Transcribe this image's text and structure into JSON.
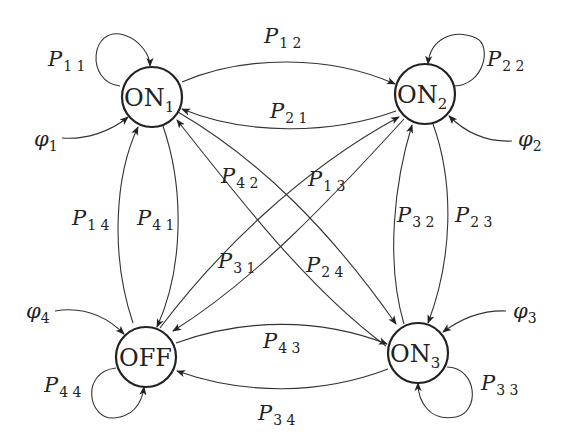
{
  "diagram": {
    "type": "markov-state-transition",
    "nodes": [
      {
        "id": "ON1",
        "base": "ON",
        "sub": "1",
        "x": 152,
        "y": 97
      },
      {
        "id": "ON2",
        "base": "ON",
        "sub": "2",
        "x": 425,
        "y": 94
      },
      {
        "id": "ON3",
        "base": "ON",
        "sub": "3",
        "x": 418,
        "y": 353
      },
      {
        "id": "OFF",
        "base": "OFF",
        "sub": "",
        "x": 146,
        "y": 357
      }
    ],
    "self_loops": [
      {
        "node": "ON1",
        "label": "P",
        "sub": "1 1"
      },
      {
        "node": "ON2",
        "label": "P",
        "sub": "2 2"
      },
      {
        "node": "ON3",
        "label": "P",
        "sub": "3 3"
      },
      {
        "node": "OFF",
        "label": "P",
        "sub": "4 4"
      }
    ],
    "initial_inputs": [
      {
        "node": "ON1",
        "label": "φ",
        "sub": "1"
      },
      {
        "node": "ON2",
        "label": "φ",
        "sub": "2"
      },
      {
        "node": "ON3",
        "label": "φ",
        "sub": "3"
      },
      {
        "node": "OFF",
        "label": "φ",
        "sub": "4"
      }
    ],
    "edges": [
      {
        "from": "ON1",
        "to": "ON2",
        "label": "P",
        "sub": "1 2"
      },
      {
        "from": "ON2",
        "to": "ON1",
        "label": "P",
        "sub": "2 1"
      },
      {
        "from": "ON1",
        "to": "ON3",
        "label": "P",
        "sub": "1 3"
      },
      {
        "from": "ON3",
        "to": "ON1",
        "label": "P",
        "sub": "3 1"
      },
      {
        "from": "ON1",
        "to": "OFF",
        "label": "P",
        "sub": "1 4"
      },
      {
        "from": "OFF",
        "to": "ON1",
        "label": "P",
        "sub": "4 1"
      },
      {
        "from": "ON2",
        "to": "ON3",
        "label": "P",
        "sub": "2 3"
      },
      {
        "from": "ON3",
        "to": "ON2",
        "label": "P",
        "sub": "3 2"
      },
      {
        "from": "ON2",
        "to": "OFF",
        "label": "P",
        "sub": "2 4"
      },
      {
        "from": "OFF",
        "to": "ON2",
        "label": "P",
        "sub": "4 2"
      },
      {
        "from": "OFF",
        "to": "ON3",
        "label": "P",
        "sub": "4 3"
      },
      {
        "from": "ON3",
        "to": "OFF",
        "label": "P",
        "sub": "3 4"
      }
    ]
  },
  "labels": {
    "on1": {
      "base": "ON",
      "sub": "1"
    },
    "on2": {
      "base": "ON",
      "sub": "2"
    },
    "on3": {
      "base": "ON",
      "sub": "3"
    },
    "off": {
      "base": "OFF"
    },
    "p11": {
      "base": "P",
      "sub": "1 1"
    },
    "p22": {
      "base": "P",
      "sub": "2 2"
    },
    "p33": {
      "base": "P",
      "sub": "3 3"
    },
    "p44": {
      "base": "P",
      "sub": "4 4"
    },
    "p12": {
      "base": "P",
      "sub": "1 2"
    },
    "p21": {
      "base": "P",
      "sub": "2 1"
    },
    "p13": {
      "base": "P",
      "sub": "1 3"
    },
    "p31": {
      "base": "P",
      "sub": "3 1"
    },
    "p14": {
      "base": "P",
      "sub": "1 4"
    },
    "p41": {
      "base": "P",
      "sub": "4 1"
    },
    "p23": {
      "base": "P",
      "sub": "2 3"
    },
    "p32": {
      "base": "P",
      "sub": "3 2"
    },
    "p24": {
      "base": "P",
      "sub": "2 4"
    },
    "p42": {
      "base": "P",
      "sub": "4 2"
    },
    "p43": {
      "base": "P",
      "sub": "4 3"
    },
    "p34": {
      "base": "P",
      "sub": "3 4"
    },
    "phi1": {
      "base": "φ",
      "sub": "1"
    },
    "phi2": {
      "base": "φ",
      "sub": "2"
    },
    "phi3": {
      "base": "φ",
      "sub": "3"
    },
    "phi4": {
      "base": "φ",
      "sub": "4"
    }
  },
  "colors": {
    "stroke": "#333333",
    "background": "#ffffff"
  }
}
